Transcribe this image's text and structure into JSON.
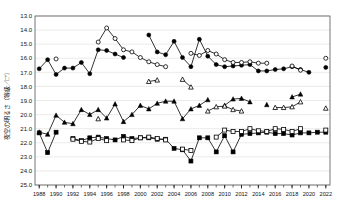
{
  "chart": {
    "ylabel": "夜空の明るさ（等級／□\"）",
    "xlabel": ""
  },
  "chart_data": {
    "type": "line",
    "title": "",
    "xlabel": "",
    "ylabel": "夜空の明るさ（等級／□\")",
    "xlim": [
      1987.5,
      2022.5
    ],
    "ylim": [
      13.0,
      25.0
    ],
    "y_inverted": true,
    "grid": true,
    "legend": "none",
    "y_ticks": [
      "13.0",
      "14.0",
      "15.0",
      "16.0",
      "17.0",
      "18.0",
      "19.0",
      "20.0",
      "21.0",
      "22.0",
      "23.0",
      "24.0",
      "25.0"
    ],
    "x_ticks": [
      "1988",
      "1990",
      "1992",
      "1994",
      "1996",
      "1998",
      "2000",
      "2002",
      "2004",
      "2006",
      "2008",
      "2010",
      "2012",
      "2014",
      "2016",
      "2018",
      "2020",
      "2022"
    ],
    "x_minor_step": 1,
    "series": [
      {
        "name": "filled-circle",
        "marker": "filled-circle",
        "color": "#000000",
        "points": [
          [
            1988,
            16.75
          ],
          [
            1989,
            16.1
          ],
          [
            1990,
            17.15
          ],
          [
            1991,
            16.7
          ],
          [
            1992,
            16.7
          ],
          [
            1993,
            16.3
          ],
          [
            1994,
            17.1
          ],
          [
            1995,
            15.4
          ],
          [
            1996,
            15.45
          ],
          [
            1997,
            15.7
          ],
          [
            1998,
            15.95
          ],
          [
            2001,
            14.35
          ],
          [
            2002,
            15.55
          ],
          [
            2003,
            15.75
          ],
          [
            2004,
            14.8
          ],
          [
            2005,
            15.95
          ],
          [
            2006,
            16.6
          ],
          [
            2007,
            14.65
          ],
          [
            2008,
            15.85
          ],
          [
            2009,
            16.45
          ],
          [
            2010,
            16.6
          ],
          [
            2011,
            16.55
          ],
          [
            2012,
            16.5
          ],
          [
            2013,
            16.45
          ],
          [
            2014,
            16.9
          ],
          [
            2015,
            16.9
          ],
          [
            2016,
            16.8
          ],
          [
            2017,
            16.75
          ],
          [
            2018,
            16.6
          ],
          [
            2019,
            16.8
          ],
          [
            2020,
            17.0
          ],
          [
            2022,
            16.65
          ]
        ]
      },
      {
        "name": "open-circle",
        "marker": "open-circle",
        "color": "#000000",
        "points": [
          [
            1990,
            16.05
          ],
          [
            1995,
            14.85
          ],
          [
            1996,
            13.85
          ],
          [
            1997,
            14.6
          ],
          [
            1998,
            15.4
          ],
          [
            1999,
            15.55
          ],
          [
            2000,
            15.95
          ],
          [
            2001,
            16.25
          ],
          [
            2002,
            16.45
          ],
          [
            2003,
            16.6
          ],
          [
            2006,
            15.65
          ],
          [
            2007,
            15.8
          ],
          [
            2008,
            15.45
          ],
          [
            2009,
            15.7
          ],
          [
            2010,
            16.1
          ],
          [
            2011,
            16.3
          ],
          [
            2012,
            16.3
          ],
          [
            2013,
            16.25
          ],
          [
            2014,
            16.35
          ],
          [
            2015,
            16.35
          ],
          [
            2018,
            16.55
          ],
          [
            2019,
            16.85
          ],
          [
            2022,
            16.0
          ]
        ]
      },
      {
        "name": "filled-triangle",
        "marker": "filled-triangle",
        "color": "#000000",
        "points": [
          [
            1988,
            21.25
          ],
          [
            1989,
            21.4
          ],
          [
            1990,
            20.05
          ],
          [
            1991,
            20.55
          ],
          [
            1992,
            20.65
          ],
          [
            1993,
            19.65
          ],
          [
            1994,
            20.0
          ],
          [
            1995,
            19.65
          ],
          [
            1996,
            20.25
          ],
          [
            1997,
            19.25
          ],
          [
            1998,
            20.5
          ],
          [
            1999,
            20.0
          ],
          [
            2000,
            19.35
          ],
          [
            2001,
            19.6
          ],
          [
            2002,
            19.2
          ],
          [
            2003,
            19.05
          ],
          [
            2004,
            19.05
          ],
          [
            2005,
            20.3
          ],
          [
            2006,
            19.6
          ],
          [
            2007,
            19.35
          ],
          [
            2008,
            18.95
          ],
          [
            2010,
            19.35
          ],
          [
            2011,
            18.9
          ],
          [
            2012,
            18.85
          ],
          [
            2013,
            19.1
          ],
          [
            2015,
            19.3
          ],
          [
            2018,
            18.75
          ],
          [
            2019,
            18.55
          ]
        ]
      },
      {
        "name": "open-triangle",
        "marker": "open-triangle",
        "color": "#000000",
        "points": [
          [
            1995,
            20.3
          ],
          [
            2001,
            17.65
          ],
          [
            2002,
            17.55
          ],
          [
            2005,
            17.5
          ],
          [
            2006,
            18.05
          ],
          [
            2008,
            19.75
          ],
          [
            2009,
            19.45
          ],
          [
            2010,
            19.4
          ],
          [
            2011,
            19.65
          ],
          [
            2012,
            19.75
          ],
          [
            2016,
            19.5
          ],
          [
            2017,
            19.5
          ],
          [
            2018,
            19.45
          ],
          [
            2019,
            19.1
          ],
          [
            2022,
            19.55
          ]
        ]
      },
      {
        "name": "filled-square",
        "marker": "filled-square",
        "color": "#000000",
        "points": [
          [
            1988,
            21.3
          ],
          [
            1989,
            22.7
          ],
          [
            1990,
            21.25
          ],
          [
            1992,
            21.7
          ],
          [
            1993,
            21.85
          ],
          [
            1994,
            21.65
          ],
          [
            1995,
            21.6
          ],
          [
            1996,
            21.7
          ],
          [
            1997,
            21.8
          ],
          [
            1998,
            21.55
          ],
          [
            1999,
            21.7
          ],
          [
            2000,
            21.65
          ],
          [
            2001,
            21.65
          ],
          [
            2002,
            21.75
          ],
          [
            2003,
            21.75
          ],
          [
            2004,
            22.4
          ],
          [
            2005,
            22.5
          ],
          [
            2006,
            23.3
          ],
          [
            2007,
            21.65
          ],
          [
            2008,
            21.65
          ],
          [
            2009,
            22.65
          ],
          [
            2010,
            21.5
          ],
          [
            2011,
            22.65
          ],
          [
            2012,
            21.4
          ],
          [
            2013,
            21.35
          ],
          [
            2014,
            21.3
          ],
          [
            2015,
            21.25
          ],
          [
            2016,
            21.35
          ],
          [
            2017,
            21.35
          ],
          [
            2018,
            21.45
          ],
          [
            2019,
            21.3
          ],
          [
            2020,
            21.3
          ],
          [
            2021,
            21.25
          ],
          [
            2022,
            21.25
          ]
        ]
      },
      {
        "name": "open-square",
        "marker": "open-square",
        "color": "#000000",
        "points": [
          [
            1992,
            21.75
          ],
          [
            1993,
            21.9
          ],
          [
            1994,
            21.95
          ],
          [
            1995,
            21.7
          ],
          [
            1996,
            21.85
          ],
          [
            1998,
            21.8
          ],
          [
            1999,
            21.85
          ],
          [
            2000,
            21.65
          ],
          [
            2001,
            21.6
          ],
          [
            2002,
            21.7
          ],
          [
            2003,
            21.8
          ],
          [
            2005,
            22.45
          ],
          [
            2006,
            22.55
          ],
          [
            2009,
            21.6
          ],
          [
            2010,
            21.1
          ],
          [
            2011,
            21.2
          ],
          [
            2012,
            21.2
          ],
          [
            2013,
            21.0
          ],
          [
            2014,
            21.15
          ],
          [
            2015,
            21.2
          ],
          [
            2016,
            21.0
          ],
          [
            2017,
            21.05
          ],
          [
            2018,
            21.2
          ],
          [
            2019,
            21.0
          ],
          [
            2022,
            21.1
          ]
        ]
      }
    ]
  }
}
